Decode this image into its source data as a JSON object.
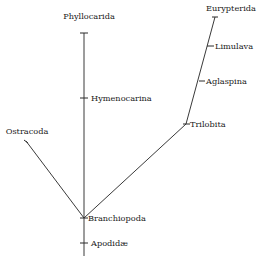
{
  "diagram": {
    "type": "phylogenetic-tree",
    "colors": {
      "line": "#3a3a3a",
      "text": "#1a1a1a",
      "background": "#ffffff"
    },
    "nodes": {
      "phyllocarida": {
        "label": "Phyllocarida"
      },
      "hymenocarina": {
        "label": "Hymenocarina"
      },
      "ostracoda": {
        "label": "Ostracoda"
      },
      "branchiopoda": {
        "label": "Branchiopoda"
      },
      "apodidae": {
        "label": "Apodidæ"
      },
      "trilobita": {
        "label": "Trilobita"
      },
      "aglaspina": {
        "label": "Aglaspina"
      },
      "limulava": {
        "label": "Limulava"
      },
      "eurypterida": {
        "label": "Eurypterida"
      }
    },
    "edges": [
      {
        "from": "branchiopoda",
        "to": "hymenocarina"
      },
      {
        "from": "hymenocarina",
        "to": "phyllocarida"
      },
      {
        "from": "branchiopoda",
        "to": "ostracoda"
      },
      {
        "from": "branchiopoda",
        "to": "apodidae"
      },
      {
        "from": "branchiopoda",
        "to": "trilobita"
      },
      {
        "from": "trilobita",
        "to": "aglaspina"
      },
      {
        "from": "aglaspina",
        "to": "limulava"
      },
      {
        "from": "limulava",
        "to": "eurypterida"
      }
    ]
  }
}
